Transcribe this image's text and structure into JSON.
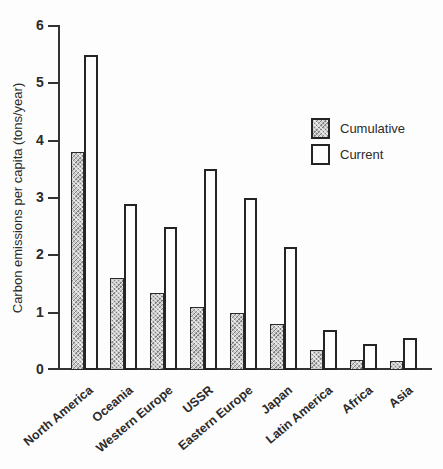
{
  "chart_data": {
    "type": "bar",
    "title": "",
    "xlabel": "",
    "ylabel": "Carbon emissions per capita (tons/year)",
    "ylim": [
      0,
      6
    ],
    "yticks": [
      0,
      1,
      2,
      3,
      4,
      5,
      6
    ],
    "grid": false,
    "legend_position": "right-upper-middle",
    "categories": [
      "North America",
      "Oceania",
      "Western Europe",
      "USSR",
      "Eastern Europe",
      "Japan",
      "Latin America",
      "Africa",
      "Asia"
    ],
    "series": [
      {
        "name": "Cumulative",
        "swatch": "hatched-gray",
        "values": [
          3.8,
          1.6,
          1.35,
          1.1,
          1.0,
          0.8,
          0.35,
          0.17,
          0.15
        ]
      },
      {
        "name": "Current",
        "swatch": "white",
        "values": [
          5.5,
          2.9,
          2.5,
          3.5,
          3.0,
          2.15,
          0.7,
          0.45,
          0.55
        ]
      }
    ]
  },
  "colors": {
    "background": "#fdfdfd",
    "axis": "#333333",
    "bar_outline": "#262626",
    "cumulative_fill": "#c9c9c9",
    "current_fill": "#fdfdfd",
    "text": "#2b2b2b"
  }
}
